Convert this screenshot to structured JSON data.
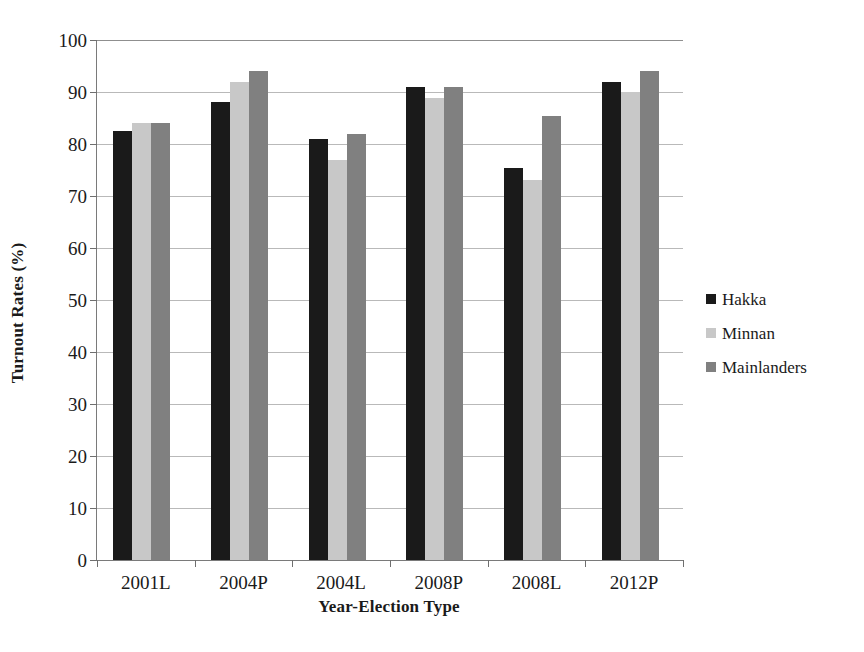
{
  "chart_data": {
    "type": "bar",
    "title": "",
    "xlabel": "Year-Election Type",
    "ylabel": "Turnout Rates (%)",
    "ylim": [
      0,
      100
    ],
    "yticks": [
      0,
      10,
      20,
      30,
      40,
      50,
      60,
      70,
      80,
      90,
      100
    ],
    "grid": true,
    "legend_position": "right",
    "categories": [
      "2001L",
      "2004P",
      "2004L",
      "2008P",
      "2008L",
      "2012P"
    ],
    "series": [
      {
        "name": "Hakka",
        "color": "#1a1a1a",
        "values": [
          82.5,
          88,
          81,
          91,
          75.3,
          92
        ]
      },
      {
        "name": "Minnan",
        "color": "#c8c8c8",
        "values": [
          84,
          92,
          77,
          88.8,
          73,
          90
        ]
      },
      {
        "name": "Mainlanders",
        "color": "#808080",
        "values": [
          84,
          94,
          82,
          91,
          85.3,
          94
        ]
      }
    ]
  }
}
